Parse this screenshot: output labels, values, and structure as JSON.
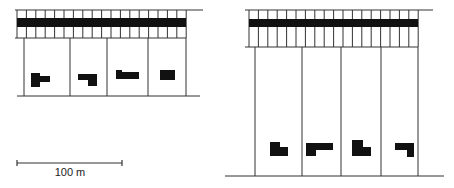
{
  "figure": {
    "type": "site-plan comparison",
    "colors": {
      "line": "#333333",
      "building": "#111111",
      "background": "#ffffff"
    }
  },
  "panels": [
    {
      "id": "left",
      "description": "Shallow plots along road",
      "road": {
        "x1": 15,
        "x2": 203,
        "top_y": 10,
        "band_top": 18,
        "band_bottom": 27,
        "bottom_y": 38,
        "tick_start": 17,
        "tick_end": 186,
        "tick_spacing": 9.4
      },
      "plot_dividers_x": [
        24,
        70,
        107,
        148,
        186
      ],
      "plot_top_y": 38,
      "baseline": {
        "y": 96,
        "x1": 17,
        "x2": 200
      },
      "buildings": [
        {
          "rects": [
            [
              31,
              73,
              9,
              14
            ],
            [
              39,
              76,
              11,
              6
            ]
          ]
        },
        {
          "rects": [
            [
              78,
              74,
              19,
              6
            ],
            [
              88,
              80,
              9,
              6
            ]
          ]
        },
        {
          "rects": [
            [
              116,
              70,
              6,
              9
            ],
            [
              122,
              72,
              17,
              7
            ]
          ]
        },
        {
          "rects": [
            [
              160,
              70,
              15,
              10
            ]
          ]
        }
      ]
    },
    {
      "id": "right",
      "description": "Deep plots along road",
      "road": {
        "x1": 245,
        "x2": 433,
        "top_y": 10,
        "band_top": 19,
        "band_bottom": 27,
        "bottom_y": 47,
        "tick_start": 249,
        "tick_end": 418,
        "tick_spacing": 9.4
      },
      "plot_dividers_x": [
        255,
        302,
        341,
        381,
        418
      ],
      "plot_top_y": 47,
      "baseline": {
        "y": 176,
        "x1": 225,
        "x2": 444
      },
      "buildings": [
        {
          "rects": [
            [
              270,
              142,
              10,
              14
            ],
            [
              280,
              147,
              8,
              9
            ]
          ]
        },
        {
          "rects": [
            [
              306,
              143,
              27,
              7
            ],
            [
              306,
              150,
              10,
              6
            ]
          ]
        },
        {
          "rects": [
            [
              352,
              140,
              11,
              16
            ],
            [
              363,
              147,
              8,
              9
            ]
          ]
        },
        {
          "rects": [
            [
              395,
              143,
              19,
              7
            ],
            [
              407,
              150,
              7,
              7
            ]
          ]
        }
      ]
    }
  ],
  "scale_bar": {
    "x1": 17,
    "x2": 122,
    "y": 163,
    "label": "100 m"
  }
}
